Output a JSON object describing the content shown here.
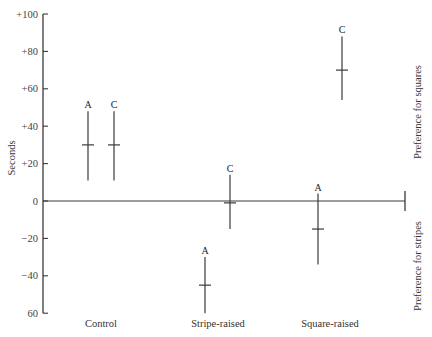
{
  "chart_data": {
    "type": "scatter",
    "subtype": "error-bar",
    "title": "",
    "xlabel": "",
    "ylabel": "Seconds",
    "ylim": [
      -60,
      100
    ],
    "yticks": [
      100,
      80,
      60,
      40,
      20,
      0,
      -20,
      -40,
      -60
    ],
    "ytick_labels": [
      "+100",
      "+80",
      "+60",
      "+40",
      "+20",
      "0",
      "−20",
      "−40",
      "60"
    ],
    "categories": [
      "Control",
      "Stripe-raised",
      "Square-raised"
    ],
    "annotations": {
      "upper_right": "Preference for squares",
      "lower_right": "Preference for stripes"
    },
    "grid": false,
    "legend": null,
    "points": [
      {
        "category": "Control",
        "label": "A",
        "mean": 30,
        "upper": 48,
        "lower": 11
      },
      {
        "category": "Control",
        "label": "C",
        "mean": 30,
        "upper": 48,
        "lower": 11
      },
      {
        "category": "Stripe-raised",
        "label": "A",
        "mean": -45,
        "upper": -30,
        "lower": -60
      },
      {
        "category": "Stripe-raised",
        "label": "C",
        "mean": -1,
        "upper": 14,
        "lower": -15
      },
      {
        "category": "Square-raised",
        "label": "A",
        "mean": -15,
        "upper": 4,
        "lower": -34
      },
      {
        "category": "Square-raised",
        "label": "C",
        "mean": 70,
        "upper": 88,
        "lower": 54
      }
    ]
  },
  "layout": {
    "axis_x": 43,
    "y_zero_px": 201,
    "px_per_unit": 1.87,
    "zero_line_end_x": 405,
    "point_x": [
      88,
      114,
      205,
      230,
      318,
      342
    ],
    "category_label_x": [
      101,
      218,
      330
    ]
  }
}
